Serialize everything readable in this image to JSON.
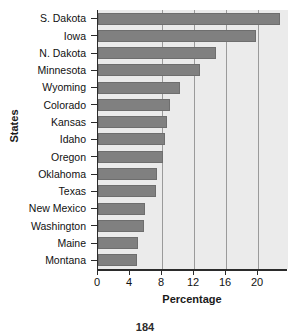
{
  "page": {
    "page_number": "184"
  },
  "chart_data": {
    "type": "bar",
    "orientation": "horizontal",
    "title": "",
    "xlabel": "Percentage",
    "ylabel": "States",
    "categories": [
      "S. Dakota",
      "Iowa",
      "N. Dakota",
      "Minnesota",
      "Wyoming",
      "Colorado",
      "Kansas",
      "Idaho",
      "Oregon",
      "Oklahoma",
      "Texas",
      "New Mexico",
      "Washington",
      "Maine",
      "Montana"
    ],
    "values": [
      22.7,
      19.7,
      14.7,
      12.7,
      10.3,
      9.0,
      8.6,
      8.4,
      8.1,
      7.4,
      7.2,
      5.9,
      5.8,
      5.0,
      4.9
    ],
    "xticks": [
      0,
      4,
      8,
      12,
      16,
      20
    ],
    "xtick_labels": [
      "0",
      "4",
      "8",
      "12",
      "16",
      "20"
    ],
    "xlim": [
      0,
      23.75
    ],
    "gridlines_x": [
      8,
      12,
      16,
      20
    ],
    "grid": true,
    "legend": "none",
    "colors": {
      "bar_fill": "#808080",
      "plot_background": "#ebebeb",
      "axis": "#2b2b2b",
      "gridline": "#9a9a9a",
      "text": "#111111"
    }
  }
}
